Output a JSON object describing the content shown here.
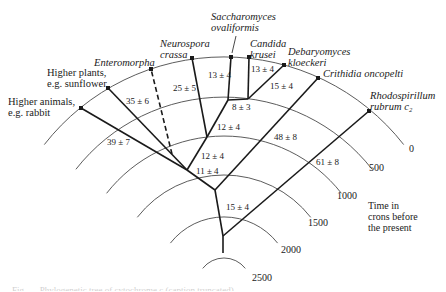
{
  "species": [
    {
      "id": "rabbit",
      "line1": "Higher animals,",
      "line2": "e.g. rabbit",
      "italic": false,
      "x": 81,
      "y": 108,
      "lx": 8,
      "ly": 96
    },
    {
      "id": "sunflower",
      "line1": "Higher plants,",
      "line2": "e.g. sunflower",
      "italic": false,
      "x": 108,
      "y": 88,
      "lx": 47,
      "ly": 67
    },
    {
      "id": "enteromorpha",
      "line1": "Enteromorpha",
      "line2": "",
      "italic": true,
      "x": 151,
      "y": 69,
      "lx": 94,
      "ly": 57
    },
    {
      "id": "neurospora",
      "line1": "Neurospora",
      "line2": "crassa",
      "italic": true,
      "x": 192,
      "y": 58,
      "lx": 160,
      "ly": 38
    },
    {
      "id": "saccharomyces",
      "line1": "Saccharomyces",
      "line2": "ovaliformis",
      "italic": true,
      "x": 231,
      "y": 57,
      "lx": 211,
      "ly": 11
    },
    {
      "id": "candida",
      "line1": "Candida",
      "line2": "krusei",
      "italic": true,
      "x": 249,
      "y": 57,
      "lx": 250,
      "ly": 38
    },
    {
      "id": "debaryomyces",
      "line1": "Debaryomyces",
      "line2": "kloeckeri",
      "italic": true,
      "x": 284,
      "y": 65,
      "lx": 288,
      "ly": 46
    },
    {
      "id": "crithidia",
      "line1": "Crithidia oncopelti",
      "line2": "",
      "italic": true,
      "x": 318,
      "y": 78,
      "lx": 323,
      "ly": 68
    },
    {
      "id": "rhodospirillum",
      "line1": "Rhodospirillum",
      "line2": "rubrum c₂",
      "italic": true,
      "x": 369,
      "y": 111,
      "lx": 370,
      "ly": 90
    }
  ],
  "branch_values": [
    {
      "text": "39 ± 7",
      "x": 107,
      "y": 138
    },
    {
      "text": "35 ± 6",
      "x": 126,
      "y": 97
    },
    {
      "text": "25 ± 5",
      "x": 173,
      "y": 84
    },
    {
      "text": "13 ± 4",
      "x": 208,
      "y": 71
    },
    {
      "text": "13 ± 4",
      "x": 251,
      "y": 65
    },
    {
      "text": "15 ± 4",
      "x": 270,
      "y": 82
    },
    {
      "text": "8 ± 3",
      "x": 232,
      "y": 103
    },
    {
      "text": "12 ± 4",
      "x": 217,
      "y": 123
    },
    {
      "text": "12 ± 4",
      "x": 201,
      "y": 152
    },
    {
      "text": "11 ± 4",
      "x": 196,
      "y": 167
    },
    {
      "text": "48 ± 8",
      "x": 274,
      "y": 133
    },
    {
      "text": "61 ± 8",
      "x": 316,
      "y": 158
    },
    {
      "text": "15 ± 4",
      "x": 226,
      "y": 203
    }
  ],
  "time_arcs": [
    {
      "label": "0",
      "r": 228,
      "lx": 409,
      "ly": 144
    },
    {
      "label": "500",
      "r": 188,
      "lx": 369,
      "ly": 163
    },
    {
      "label": "1000",
      "r": 149,
      "lx": 337,
      "ly": 191
    },
    {
      "label": "1500",
      "r": 110,
      "lx": 308,
      "ly": 218
    },
    {
      "label": "2000",
      "r": 68,
      "lx": 281,
      "ly": 245
    },
    {
      "label": "2500",
      "r": 27,
      "lx": 252,
      "ly": 273
    }
  ],
  "axis_title": {
    "line1": "Time in",
    "line2": "crons before",
    "line3": "the present"
  },
  "caption": "Fig. — Phylogenetic tree of cytochrome c (caption truncated)",
  "colors": {
    "ink": "#1a1a1a",
    "arc": "#4a4a4a"
  }
}
